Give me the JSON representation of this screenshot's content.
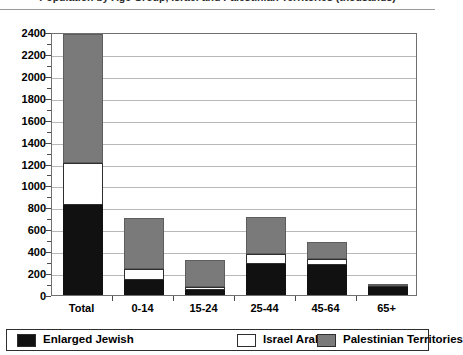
{
  "chart_data": {
    "type": "bar",
    "stacked": true,
    "title": "Population by Age Group, Israel and Palestinian Territories (thousands)",
    "title_clipped": true,
    "xlabel": "",
    "ylabel": "",
    "ylim": [
      0,
      2400
    ],
    "ytick_step": 200,
    "grid": true,
    "legend_position": "bottom",
    "categories": [
      "Total",
      "0-14",
      "15-24",
      "25-44",
      "45-64",
      "65+"
    ],
    "ytick_labels": [
      "0",
      "200",
      "400",
      "600",
      "800",
      "1000",
      "1200",
      "1400",
      "1600",
      "1800",
      "2000",
      "2200",
      "2400"
    ],
    "series": [
      {
        "name": "Enlarged Jewish",
        "color": "#111111",
        "values": [
          820,
          135,
          45,
          280,
          275,
          70
        ]
      },
      {
        "name": "Israel Arabs",
        "color": "#ffffff",
        "values": [
          385,
          100,
          30,
          90,
          55,
          15
        ]
      },
      {
        "name": "Palestinian Territories",
        "color": "#7a7a7a",
        "values": [
          1175,
          465,
          245,
          345,
          150,
          20
        ]
      }
    ],
    "totals": [
      2380,
      700,
      320,
      715,
      480,
      105
    ]
  },
  "legend": {
    "items": [
      {
        "label": "Enlarged Jewish",
        "swatch": "#111111"
      },
      {
        "label": "Israel Arabs",
        "swatch": "#ffffff"
      },
      {
        "label": "Palestinian Territories",
        "swatch": "#7a7a7a"
      }
    ]
  }
}
